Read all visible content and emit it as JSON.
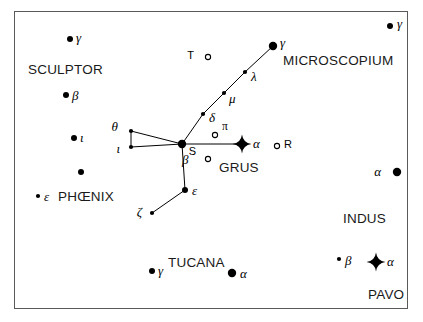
{
  "figure": {
    "kind": "star-chart",
    "width": 423,
    "height": 322,
    "background_color": "#ffffff",
    "frame_color": "#5a5a5a",
    "ink_color": "#000000"
  },
  "chart_data": {
    "type": "scatter",
    "title": "",
    "subtitle": "",
    "xlabel": "",
    "ylabel": "",
    "xlim": [
      0,
      423
    ],
    "ylim": [
      0,
      322
    ],
    "grid": false,
    "legend": null,
    "marker_legend": [
      {
        "key": "bright",
        "shape": "4-point-star",
        "meaning": "brightest magnitude star"
      },
      {
        "key": "large",
        "shape": "filled-circle-large",
        "meaning": "bright star"
      },
      {
        "key": "medium",
        "shape": "filled-circle-medium",
        "meaning": "medium star"
      },
      {
        "key": "small",
        "shape": "filled-circle-small",
        "meaning": "faint star"
      },
      {
        "key": "open",
        "shape": "open-circle",
        "meaning": "variable star"
      }
    ],
    "constellations": [
      {
        "name": "SCULPTOR",
        "label_x": 28,
        "label_y": 63
      },
      {
        "name": "MICROSCOPIUM",
        "label_x": 283,
        "label_y": 54
      },
      {
        "name": "GRUS",
        "label_x": 219,
        "label_y": 161
      },
      {
        "name": "PHŒNIX",
        "label_x": 58,
        "label_y": 190
      },
      {
        "name": "TUCANA",
        "label_x": 168,
        "label_y": 256
      },
      {
        "name": "INDUS",
        "label_x": 343,
        "label_y": 212
      },
      {
        "name": "PAVO",
        "label_x": 368,
        "label_y": 288
      }
    ],
    "stars": [
      {
        "id": "sculptor-gamma",
        "label": "γ",
        "x": 70,
        "y": 39,
        "marker": "medium",
        "label_dx": 6,
        "label_dy": -1,
        "constellation": "SCULPTOR"
      },
      {
        "id": "sculptor-beta",
        "label": "β",
        "x": 66,
        "y": 95,
        "marker": "medium",
        "label_dx": 6,
        "label_dy": 1,
        "constellation": "SCULPTOR"
      },
      {
        "id": "sculptor-iota",
        "label": "ι",
        "x": 74,
        "y": 138,
        "marker": "medium",
        "label_dx": 6,
        "label_dy": 0,
        "constellation": "SCULPTOR"
      },
      {
        "id": "grus-theta",
        "label": "θ",
        "x": 131,
        "y": 131,
        "marker": "small",
        "label_dx": -13,
        "label_dy": -4,
        "constellation": "GRUS"
      },
      {
        "id": "grus-iota",
        "label": "ι",
        "x": 131,
        "y": 147,
        "marker": "small",
        "label_dx": -11,
        "label_dy": 2,
        "constellation": "GRUS"
      },
      {
        "id": "grus-beta",
        "label": "β",
        "x": 182,
        "y": 144,
        "marker": "large",
        "label_dx": 0,
        "label_dy": 16,
        "constellation": "GRUS"
      },
      {
        "id": "grus-delta",
        "label": "δ",
        "x": 203,
        "y": 114,
        "marker": "small",
        "label_dx": 6,
        "label_dy": 4,
        "constellation": "GRUS"
      },
      {
        "id": "grus-mu",
        "label": "μ",
        "x": 224,
        "y": 93,
        "marker": "small",
        "label_dx": 5,
        "label_dy": 6,
        "constellation": "GRUS"
      },
      {
        "id": "grus-lambda",
        "label": "λ",
        "x": 245,
        "y": 72,
        "marker": "small",
        "label_dx": 6,
        "label_dy": 5,
        "constellation": "GRUS"
      },
      {
        "id": "microscopium-gamma",
        "label": "γ",
        "x": 273,
        "y": 46,
        "marker": "large",
        "label_dx": 7,
        "label_dy": -3,
        "constellation": "MICROSCOPIUM"
      },
      {
        "id": "grus-alpha",
        "label": "α",
        "x": 242,
        "y": 144,
        "marker": "bright",
        "label_dx": 11,
        "label_dy": 0,
        "constellation": "GRUS"
      },
      {
        "id": "grus-epsilon",
        "label": "ε",
        "x": 185,
        "y": 190,
        "marker": "medium",
        "label_dx": 7,
        "label_dy": 1,
        "constellation": "GRUS"
      },
      {
        "id": "grus-zeta",
        "label": "ζ",
        "x": 152,
        "y": 213,
        "marker": "small",
        "label_dx": -10,
        "label_dy": -1,
        "constellation": "GRUS"
      },
      {
        "id": "phoenix-epsilon",
        "label": "ε",
        "x": 38,
        "y": 196,
        "marker": "small",
        "label_dx": 6,
        "label_dy": 1,
        "constellation": "PHŒNIX"
      },
      {
        "id": "phoenix-unnamed",
        "label": "",
        "x": 81,
        "y": 172,
        "marker": "medium",
        "label_dx": 0,
        "label_dy": 0,
        "constellation": "PHŒNIX"
      },
      {
        "id": "tucana-gamma",
        "label": "γ",
        "x": 152,
        "y": 271,
        "marker": "medium",
        "label_dx": 6,
        "label_dy": 0,
        "constellation": "TUCANA"
      },
      {
        "id": "tucana-alpha",
        "label": "α",
        "x": 232,
        "y": 273,
        "marker": "large",
        "label_dx": 8,
        "label_dy": 1,
        "constellation": "TUCANA"
      },
      {
        "id": "indus-alpha",
        "label": "α",
        "x": 397,
        "y": 172,
        "marker": "large",
        "label_dx": -16,
        "label_dy": 0,
        "constellation": "INDUS"
      },
      {
        "id": "pavo-beta",
        "label": "β",
        "x": 339,
        "y": 259,
        "marker": "small",
        "label_dx": 6,
        "label_dy": 2,
        "constellation": "PAVO"
      },
      {
        "id": "pavo-alpha",
        "label": "α",
        "x": 376,
        "y": 262,
        "marker": "bright",
        "label_dx": 11,
        "label_dy": 0,
        "constellation": "PAVO"
      },
      {
        "id": "topright-gamma",
        "label": "γ",
        "x": 390,
        "y": 26,
        "marker": "medium",
        "label_dx": 7,
        "label_dy": -2,
        "constellation": "MICROSCOPIUM"
      }
    ],
    "variable_stars": [
      {
        "id": "var-T",
        "label": "T",
        "x": 208,
        "y": 57,
        "label_dx": -14,
        "label_dy": -1,
        "marker": "open"
      },
      {
        "id": "var-pi",
        "label": "π",
        "x": 215,
        "y": 135,
        "label_dx": 7,
        "label_dy": -8,
        "marker": "open"
      },
      {
        "id": "var-S",
        "label": "S",
        "x": 208,
        "y": 159,
        "label_dx": -12,
        "label_dy": -7,
        "marker": "open"
      },
      {
        "id": "var-R",
        "label": "R",
        "x": 277,
        "y": 146,
        "label_dx": 7,
        "label_dy": -1,
        "marker": "open"
      }
    ],
    "constellation_lines": [
      {
        "from": "grus-theta",
        "to": "grus-iota"
      },
      {
        "from": "grus-theta",
        "to": "grus-beta"
      },
      {
        "from": "grus-iota",
        "to": "grus-beta"
      },
      {
        "from": "grus-beta",
        "to": "grus-delta"
      },
      {
        "from": "grus-delta",
        "to": "grus-mu"
      },
      {
        "from": "grus-mu",
        "to": "grus-lambda"
      },
      {
        "from": "grus-lambda",
        "to": "microscopium-gamma"
      },
      {
        "from": "grus-beta",
        "to": "grus-alpha"
      },
      {
        "from": "grus-beta",
        "to": "grus-epsilon"
      },
      {
        "from": "grus-epsilon",
        "to": "grus-zeta"
      }
    ]
  }
}
